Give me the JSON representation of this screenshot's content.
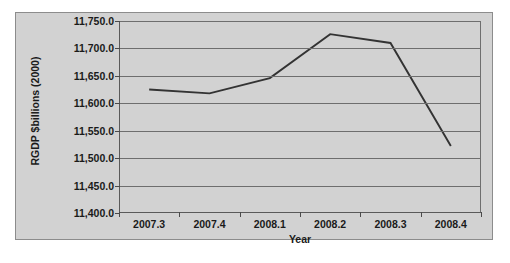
{
  "chart_data": {
    "type": "line",
    "title": "",
    "xlabel": "Year",
    "ylabel": "RGDP $billions (2000)",
    "categories": [
      "2007.3",
      "2007.4",
      "2008.1",
      "2008.2",
      "2008.3",
      "2008.4"
    ],
    "values": [
      11625.0,
      11618.0,
      11646.0,
      11726.0,
      11710.0,
      11522.0
    ],
    "series": [
      {
        "name": "RGDP",
        "values": [
          11625.0,
          11618.0,
          11646.0,
          11726.0,
          11710.0,
          11522.0
        ]
      }
    ],
    "ylim": [
      11400.0,
      11750.0
    ],
    "ytick_values": [
      11400.0,
      11450.0,
      11500.0,
      11550.0,
      11600.0,
      11650.0,
      11700.0,
      11750.0
    ],
    "ytick_labels": [
      "11,400.0",
      "11,450.0",
      "11,500.0",
      "11,550.0",
      "11,600.0",
      "11,650.0",
      "11,700.0",
      "11,750.0"
    ],
    "grid": true,
    "legend": false,
    "legend_position": "none",
    "line_color": "#333333",
    "plot_background": "#d2d2d2",
    "grid_color": "#6e6e6e",
    "axis_color": "#5a5a5a",
    "text_color": "#1a1a1a"
  }
}
